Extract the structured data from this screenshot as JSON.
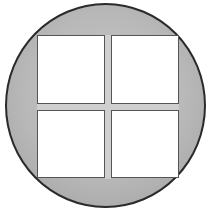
{
  "figure": {
    "colors": {
      "circle_fill": "#b8b8b8",
      "circle_border": "#2a2a2a",
      "pane_fill": "#ffffff",
      "pane_border": "#555555",
      "mullion": "#cfcfcf"
    },
    "panes": [
      {
        "position": "top-left"
      },
      {
        "position": "top-right"
      },
      {
        "position": "bottom-left"
      },
      {
        "position": "bottom-right"
      }
    ]
  }
}
